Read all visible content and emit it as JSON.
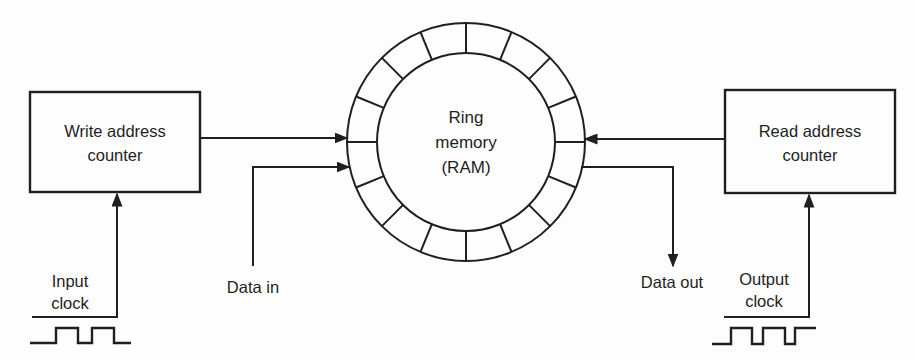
{
  "diagram": {
    "type": "block-diagram"
  },
  "boxes": {
    "write_counter": {
      "line1": "Write address",
      "line2": "counter"
    },
    "read_counter": {
      "line1": "Read address",
      "line2": "counter"
    }
  },
  "ring": {
    "line1": "Ring",
    "line2": "memory",
    "line3": "(RAM)",
    "segments": 16
  },
  "labels": {
    "data_in": "Data in",
    "data_out": "Data out",
    "input_clock": {
      "line1": "Input",
      "line2": "clock"
    },
    "output_clock": {
      "line1": "Output",
      "line2": "clock"
    }
  },
  "icons": {
    "input_clock_waveform": "square-wave",
    "output_clock_waveform": "square-wave"
  },
  "colors": {
    "ink": "#1f1f1f",
    "background": "#fdfdfd"
  }
}
